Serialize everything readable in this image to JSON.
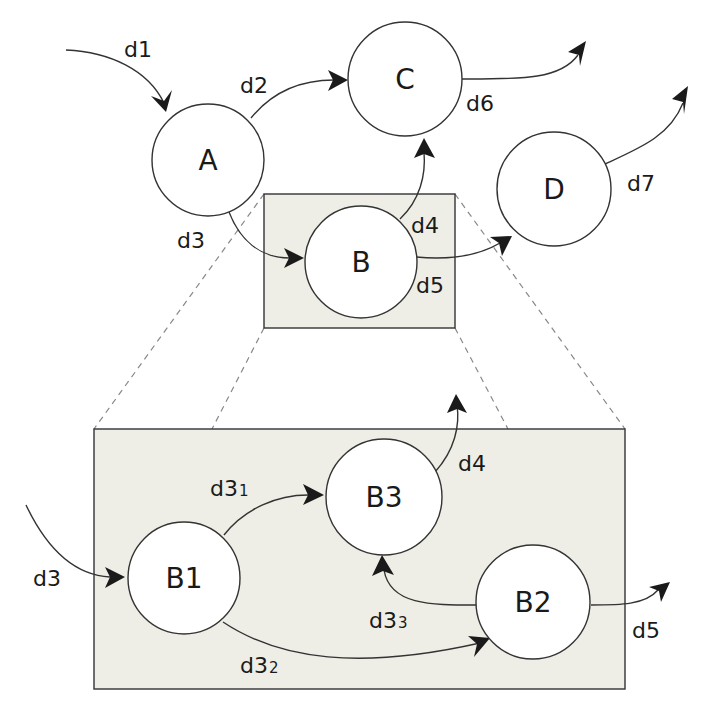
{
  "diagram": {
    "type": "data flow / state diagram with zoom-in detail",
    "colors": {
      "background": "#ffffff",
      "box_fill": "#eeeee6",
      "stroke": "#333333",
      "text": "#1a1a1a",
      "dashed_guide": "#888888"
    },
    "top_level": {
      "nodes": [
        {
          "id": "A",
          "label": "A"
        },
        {
          "id": "B",
          "label": "B"
        },
        {
          "id": "C",
          "label": "C"
        },
        {
          "id": "D",
          "label": "D"
        }
      ],
      "edges": [
        {
          "id": "d1",
          "label": "d1",
          "from": "external",
          "to": "A"
        },
        {
          "id": "d2",
          "label": "d2",
          "from": "A",
          "to": "C"
        },
        {
          "id": "d3",
          "label": "d3",
          "from": "A",
          "to": "B"
        },
        {
          "id": "d4",
          "label": "d4",
          "from": "B",
          "to": "C"
        },
        {
          "id": "d5",
          "label": "d5",
          "from": "B",
          "to": "D"
        },
        {
          "id": "d6",
          "label": "d6",
          "from": "C",
          "to": "external"
        },
        {
          "id": "d7",
          "label": "d7",
          "from": "D",
          "to": "external"
        }
      ]
    },
    "detail_of_B": {
      "nodes": [
        {
          "id": "B1",
          "label": "B1"
        },
        {
          "id": "B2",
          "label": "B2"
        },
        {
          "id": "B3",
          "label": "B3"
        }
      ],
      "edges": [
        {
          "id": "d3",
          "label": "d3",
          "sub": "",
          "from": "external",
          "to": "B1"
        },
        {
          "id": "d3_1",
          "label": "d3",
          "sub": "1",
          "from": "B1",
          "to": "B3"
        },
        {
          "id": "d3_2",
          "label": "d3",
          "sub": "2",
          "from": "B1",
          "to": "B2"
        },
        {
          "id": "d3_3",
          "label": "d3",
          "sub": "3",
          "from": "B2",
          "to": "B3"
        },
        {
          "id": "d4",
          "label": "d4",
          "sub": "",
          "from": "B3",
          "to": "external"
        },
        {
          "id": "d5",
          "label": "d5",
          "sub": "",
          "from": "B2",
          "to": "external"
        }
      ]
    }
  }
}
